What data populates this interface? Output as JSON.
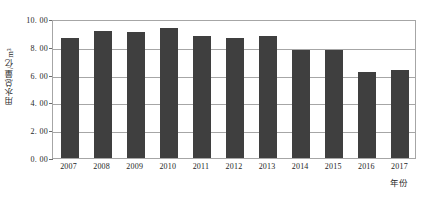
{
  "chart_data": {
    "type": "bar",
    "title": "",
    "xlabel": "年份",
    "ylabel": "用水总量/亿m³",
    "categories": [
      "2007",
      "2008",
      "2009",
      "2010",
      "2011",
      "2012",
      "2013",
      "2014",
      "2015",
      "2016",
      "2017"
    ],
    "values": [
      8.6,
      9.15,
      9.05,
      9.35,
      8.75,
      8.6,
      8.8,
      7.8,
      7.8,
      6.2,
      6.35
    ],
    "ylim": [
      0.0,
      10.0
    ],
    "ytick_values": [
      0.0,
      2.0,
      4.0,
      6.0,
      8.0,
      10.0
    ],
    "ytick_labels": [
      "0. 00",
      "2. 00",
      "4. 00",
      "6. 00",
      "8. 00",
      "10. 00"
    ],
    "grid": true,
    "legend": false,
    "legend_position": "none",
    "series": [
      {
        "name": "用水总量",
        "color": "#3f3f3f",
        "values": [
          8.6,
          9.15,
          9.05,
          9.35,
          8.75,
          8.6,
          8.8,
          7.8,
          7.8,
          6.2,
          6.35
        ]
      }
    ]
  },
  "style": {
    "bar_color": "#3f3f3f",
    "grid_color": "#a6a6a6",
    "axis_color": "#a6a6a6",
    "text_color": "#1e1e1e",
    "background": "#ffffff"
  }
}
